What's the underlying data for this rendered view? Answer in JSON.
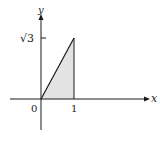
{
  "diagram": {
    "axes": {
      "x_label": "x",
      "y_label": "y",
      "origin_label": "0"
    },
    "ticks": {
      "x_tick_label": "1",
      "y_tick_label": "√3"
    },
    "region": {
      "shape": "triangle",
      "vertices": [
        [
          0,
          0
        ],
        [
          1,
          0
        ],
        [
          1,
          1.732
        ]
      ],
      "fill": "#e3e3e3",
      "stroke": "#1a1a1a"
    }
  }
}
